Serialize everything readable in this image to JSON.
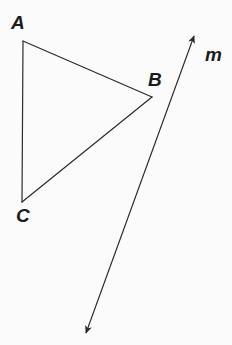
{
  "figure": {
    "kind": "geometry-diagram",
    "width": 232,
    "height": 345,
    "background_color": "#fbfbfc",
    "stroke_color": "#2a2a30",
    "text_color": "#1b1b1f",
    "stroke_width": 1.2
  },
  "triangle": {
    "name": "triangle-abc",
    "vertices": [
      {
        "id": "A",
        "label": "A",
        "x": 23,
        "y": 41,
        "label_x": 11,
        "label_y": 13
      },
      {
        "id": "B",
        "label": "B",
        "x": 152,
        "y": 97,
        "label_x": 148,
        "label_y": 70
      },
      {
        "id": "C",
        "label": "C",
        "x": 22,
        "y": 202,
        "label_x": 16,
        "label_y": 206
      }
    ],
    "edges": [
      {
        "id": "AB",
        "from": "A",
        "to": "B"
      },
      {
        "id": "BC",
        "from": "B",
        "to": "C"
      },
      {
        "id": "CA",
        "from": "C",
        "to": "A"
      }
    ]
  },
  "line": {
    "name": "line-m",
    "label": "m",
    "label_x": 205,
    "label_y": 45,
    "arrowheads": "both",
    "start": {
      "x": 194,
      "y": 36
    },
    "end": {
      "x": 86,
      "y": 333
    }
  }
}
